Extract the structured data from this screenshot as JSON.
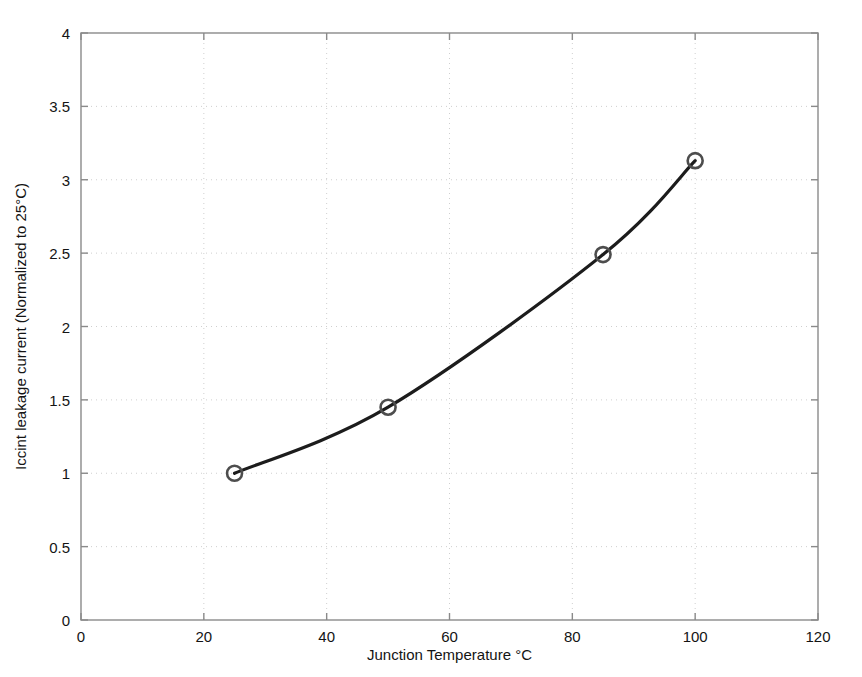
{
  "chart_data": {
    "type": "line",
    "title": "",
    "xlabel": "Junction Temperature °C",
    "ylabel": "Iccint leakage current (Normalized to 25°C)",
    "xlim": [
      0,
      120
    ],
    "ylim": [
      0,
      4
    ],
    "xticks": [
      0,
      20,
      40,
      60,
      80,
      100,
      120
    ],
    "xtick_labels": [
      "0",
      "20",
      "40",
      "60",
      "80",
      "100",
      "120"
    ],
    "yticks": [
      0,
      0.5,
      1,
      1.5,
      2,
      2.5,
      3,
      3.5,
      4
    ],
    "ytick_labels": [
      "0",
      "0.5",
      "1",
      "1.5",
      "2",
      "2.5",
      "3",
      "3.5",
      "4"
    ],
    "grid": true,
    "grid_style": "dotted",
    "legend": null,
    "marker": "open-circle",
    "x": [
      25,
      50,
      85,
      100
    ],
    "values": [
      1.0,
      1.45,
      2.49,
      3.13
    ],
    "series": [
      {
        "name": "Iccint leakage current",
        "x": [
          25,
          50,
          85,
          100
        ],
        "values": [
          1.0,
          1.45,
          2.49,
          3.13
        ]
      }
    ],
    "colors": {
      "line": "#1c1c1c",
      "marker_edge": "#4d4d4d",
      "grid": "#cfcfcf",
      "axis": "#8a8a8a",
      "text": "#141414",
      "background": "#ffffff"
    }
  }
}
